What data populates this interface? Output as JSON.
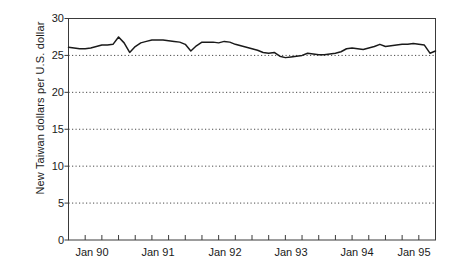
{
  "chart_data": {
    "type": "line",
    "title": "",
    "subtitle": "",
    "xlabel": "",
    "ylabel": "New Taiwan dollars per U.S. dollar",
    "ylim": [
      0,
      30
    ],
    "xlim": [
      "Jan 90",
      "Jul 95"
    ],
    "y_ticks": [
      0,
      5,
      10,
      15,
      20,
      25,
      30
    ],
    "y_tick_labels": [
      "0",
      "5",
      "10",
      "15",
      "20",
      "25",
      "30"
    ],
    "x_tick_labels": [
      "Jan 90",
      "Jan 91",
      "Jan 92",
      "Jan 93",
      "Jan 94",
      "Jan 95"
    ],
    "x_tick_label_values": [
      0,
      12,
      24,
      36,
      48,
      60
    ],
    "minor_tick_interval_months": 3,
    "grid": "horizontal dotted gridlines at 5,10,15,20,25",
    "legend": "none",
    "line_color": "#1a1a1a",
    "series": [
      {
        "name": "NT$ per US$",
        "x": [
          0,
          1,
          2,
          3,
          4,
          5,
          6,
          7,
          8,
          9,
          10,
          11,
          12,
          13,
          14,
          15,
          16,
          17,
          18,
          19,
          20,
          21,
          22,
          23,
          24,
          25,
          26,
          27,
          28,
          29,
          30,
          31,
          32,
          33,
          34,
          35,
          36,
          37,
          38,
          39,
          40,
          41,
          42,
          43,
          44,
          45,
          46,
          47,
          48,
          49,
          50,
          51,
          52,
          53,
          54,
          55,
          56,
          57,
          58,
          59,
          60,
          61,
          62,
          63,
          64,
          65,
          66
        ],
        "values": [
          26.1,
          26.0,
          25.9,
          25.9,
          26.0,
          26.2,
          26.4,
          26.4,
          26.5,
          27.5,
          26.7,
          25.4,
          26.2,
          26.7,
          26.9,
          27.1,
          27.1,
          27.1,
          27.0,
          26.9,
          26.8,
          26.5,
          25.6,
          26.3,
          26.8,
          26.8,
          26.8,
          26.7,
          26.9,
          26.8,
          26.5,
          26.3,
          26.1,
          25.9,
          25.7,
          25.4,
          25.3,
          25.4,
          24.9,
          24.7,
          24.8,
          24.9,
          25.0,
          25.3,
          25.2,
          25.1,
          25.1,
          25.2,
          25.3,
          25.5,
          25.9,
          26.0,
          25.9,
          25.8,
          26.0,
          26.2,
          26.5,
          26.2,
          26.3,
          26.4,
          26.5,
          26.5,
          26.6,
          26.5,
          26.4,
          25.3,
          25.6
        ]
      }
    ]
  }
}
